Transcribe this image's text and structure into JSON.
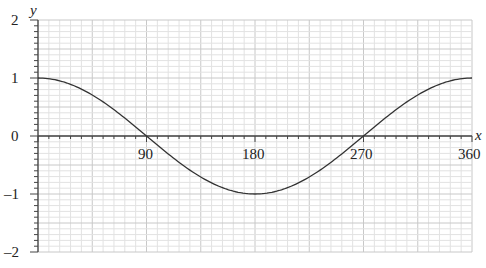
{
  "chart_data": {
    "type": "line",
    "title": "",
    "xlabel": "x",
    "ylabel": "y",
    "xlim": [
      0,
      360
    ],
    "ylim": [
      -2,
      2
    ],
    "x_ticks": [
      "90",
      "180",
      "270",
      "360"
    ],
    "y_ticks": [
      "2",
      "1",
      "0",
      "–1",
      "–2"
    ],
    "grid": true,
    "series": [
      {
        "name": "y = cos x",
        "x": [
          0,
          30,
          60,
          90,
          120,
          150,
          180,
          210,
          240,
          270,
          300,
          330,
          360
        ],
        "values": [
          1,
          0.866,
          0.5,
          0,
          -0.5,
          -0.866,
          -1,
          -0.866,
          -0.5,
          0,
          0.5,
          0.866,
          1
        ]
      }
    ]
  },
  "colors": {
    "curve": "#333333",
    "axis": "#444444",
    "grid_minor": "#e2e2e2",
    "grid_major": "#c8c8c8"
  }
}
